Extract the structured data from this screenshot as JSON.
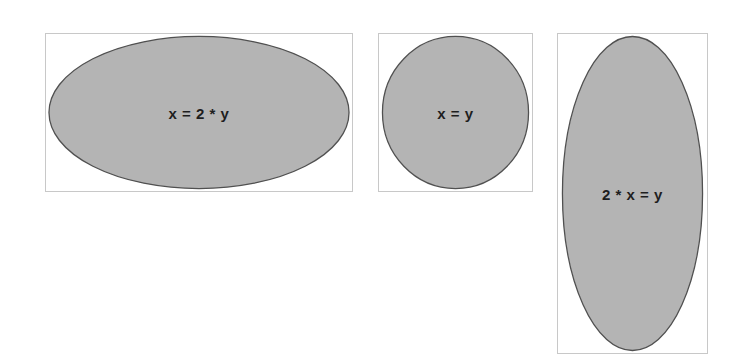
{
  "diagram": {
    "style": {
      "frame_border": "#c8c8c8",
      "ellipse_fill": "#b4b4b4",
      "ellipse_stroke": "#505050",
      "label_color": "#1e1e1e"
    },
    "shapes": [
      {
        "id": "wide-ellipse",
        "label": "x = 2 * y",
        "frame": {
          "left": 45,
          "top": 33,
          "width": 308,
          "height": 159
        }
      },
      {
        "id": "circle",
        "label": "x = y",
        "frame": {
          "left": 378,
          "top": 33,
          "width": 155,
          "height": 159
        }
      },
      {
        "id": "tall-ellipse",
        "label": "2 * x = y",
        "frame": {
          "left": 557,
          "top": 33,
          "width": 151,
          "height": 321
        }
      }
    ]
  }
}
